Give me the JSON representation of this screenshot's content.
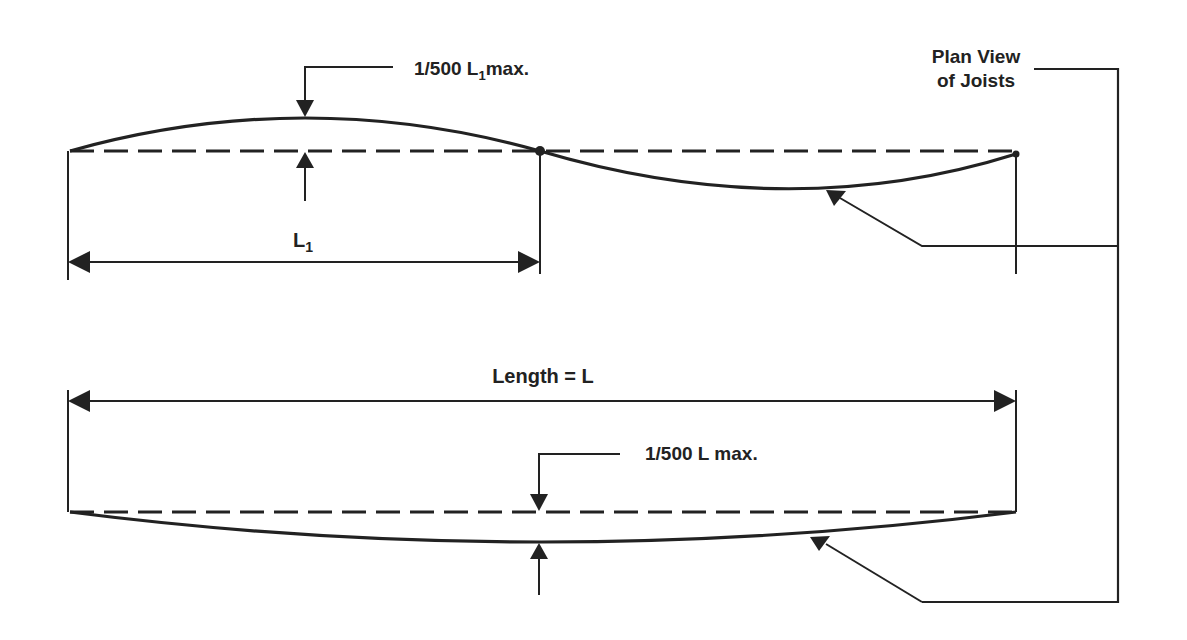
{
  "diagram": {
    "labels": {
      "top_deflection": "1/500 L",
      "top_deflection_sub": "1",
      "top_deflection_suffix": "max.",
      "span_label": "L",
      "span_label_sub": "1",
      "plan_view_line1": "Plan View",
      "plan_view_line2": "of Joists",
      "length_label": "Length = L",
      "bottom_deflection": "1/500 L max."
    },
    "colors": {
      "ink": "#222222",
      "background": "#ffffff"
    },
    "figures": [
      {
        "name": "reverse-curve-joist",
        "description": "S-curve joist with inflection point at L1; max deflection 1/500 L1"
      },
      {
        "name": "single-curve-joist",
        "description": "Single sag curve joist over length L; max deflection 1/500 L"
      }
    ]
  }
}
